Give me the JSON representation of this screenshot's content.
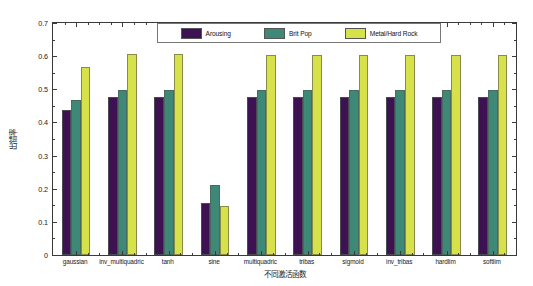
{
  "chart_data": {
    "type": "bar",
    "title": "",
    "xlabel": "不同激活函数",
    "ylabel": "出错率",
    "ylim": [
      0,
      0.7
    ],
    "ytick_labels": [
      "0",
      "0.1",
      "0.2",
      "0.3",
      "0.4",
      "0.5",
      "0.6",
      "0.7"
    ],
    "ytick_values": [
      0,
      0.1,
      0.2,
      0.3,
      0.4,
      0.5,
      0.6,
      0.7
    ],
    "grid": false,
    "legend_position": "upper center",
    "categories": [
      "gaussian",
      "inv_multiquadric",
      "tanh",
      "sine",
      "multiquadric",
      "tribas",
      "sigmoid",
      "inv_tribas",
      "hardlim",
      "softlim"
    ],
    "series": [
      {
        "name": "Arousing",
        "color": "#3d1152",
        "values": [
          0.437,
          0.478,
          0.478,
          0.158,
          0.477,
          0.477,
          0.478,
          0.476,
          0.478,
          0.477
        ]
      },
      {
        "name": "Brit Pop",
        "color": "#3e8878",
        "values": [
          0.467,
          0.499,
          0.499,
          0.21,
          0.499,
          0.497,
          0.499,
          0.499,
          0.498,
          0.499
        ]
      },
      {
        "name": "Metal/Hard Rock",
        "color": "#d7e24a",
        "values": [
          0.568,
          0.608,
          0.606,
          0.148,
          0.605,
          0.605,
          0.604,
          0.605,
          0.604,
          0.604
        ]
      }
    ]
  }
}
